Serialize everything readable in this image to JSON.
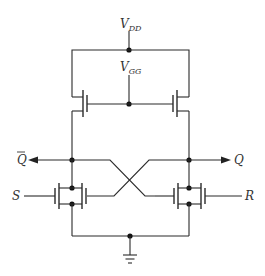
{
  "diagram": {
    "title": "",
    "type": "CMOS-style cross-coupled SR latch (NMOS with depletion loads)",
    "labels": {
      "vdd": {
        "main": "V",
        "sub": "DD"
      },
      "vgg": {
        "main": "V",
        "sub": "GG"
      },
      "q_bar": "Q",
      "q": "Q",
      "s": "S",
      "r": "R"
    },
    "nodes": [
      {
        "id": "vdd",
        "x": 129,
        "y": 50
      },
      {
        "id": "vgg",
        "x": 129,
        "y": 104
      },
      {
        "id": "q_bar",
        "x": 72,
        "y": 160
      },
      {
        "id": "q",
        "x": 189,
        "y": 160
      },
      {
        "id": "gnd",
        "x": 130,
        "y": 236
      }
    ],
    "components": [
      {
        "id": "M_load_left",
        "kind": "nmos-load",
        "gate": "vgg"
      },
      {
        "id": "M_load_right",
        "kind": "nmos-load",
        "gate": "vgg"
      },
      {
        "id": "M_s_left",
        "kind": "nmos",
        "gate": "S"
      },
      {
        "id": "M_fb_left",
        "kind": "nmos",
        "gate": "Q"
      },
      {
        "id": "M_fb_right",
        "kind": "nmos",
        "gate": "Q_bar"
      },
      {
        "id": "M_r_right",
        "kind": "nmos",
        "gate": "R"
      }
    ],
    "colors": {
      "line": "#2a2a2a",
      "background": "#ffffff"
    }
  }
}
